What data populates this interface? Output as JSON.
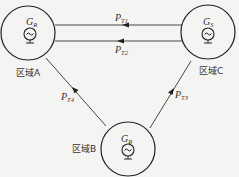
{
  "diagram": {
    "type": "power-flow-between-areas",
    "areas": [
      {
        "id": "A",
        "label": "区域A",
        "generator": {
          "symbol": "G",
          "subscript": "R"
        }
      },
      {
        "id": "C",
        "label": "区域C",
        "generator": {
          "symbol": "G",
          "subscript": "S"
        }
      },
      {
        "id": "B",
        "label": "区域B",
        "generator": {
          "symbol": "G",
          "subscript": "R"
        }
      }
    ],
    "flows": [
      {
        "symbol": "P",
        "subscript": "T1",
        "from": "C",
        "to": "A"
      },
      {
        "symbol": "P",
        "subscript": "T2",
        "from": "C",
        "to": "A"
      },
      {
        "symbol": "P",
        "subscript": "T4",
        "from": "B",
        "to": "A"
      },
      {
        "symbol": "P",
        "subscript": "T3",
        "from": "B",
        "to": "C"
      }
    ]
  }
}
